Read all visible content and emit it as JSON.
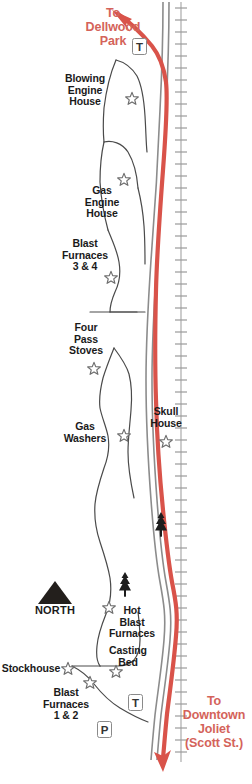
{
  "map": {
    "title": "Joliet Iron Works Historic Site Trail Map",
    "colors": {
      "route_red": "#d9534a",
      "road_gray": "#8c8c8c",
      "outline_gray": "#555555",
      "rail_gray": "#999999",
      "text_black": "#1a1a1a",
      "text_red": "#d4635a",
      "north_black": "#231f1c"
    },
    "direction_labels": [
      {
        "name": "to-dellwood-park",
        "text": "To\nDellwood\nPark",
        "x": 74,
        "y": 6,
        "width": 78
      },
      {
        "name": "to-downtown-joliet",
        "text": "To\nDowntown\nJoliet\n(Scott St.)",
        "x": 176,
        "y": 694,
        "width": 76
      }
    ],
    "site_labels": [
      {
        "name": "blowing-engine-house",
        "text": "Blowing\nEngine\nHouse",
        "x": 56,
        "y": 73,
        "width": 58
      },
      {
        "name": "gas-engine-house",
        "text": "Gas\nEngine\nHouse",
        "x": 79,
        "y": 185,
        "width": 46
      },
      {
        "name": "blast-furnaces-3-4",
        "text": "Blast\nFurnaces\n3 & 4",
        "x": 58,
        "y": 238,
        "width": 54
      },
      {
        "name": "four-pass-stoves",
        "text": "Four\nPass\nStoves",
        "x": 62,
        "y": 322,
        "width": 48
      },
      {
        "name": "gas-washers",
        "text": "Gas\nWashers",
        "x": 58,
        "y": 421,
        "width": 54
      },
      {
        "name": "skull-house",
        "text": "Skull\nHouse",
        "x": 146,
        "y": 406,
        "width": 40
      },
      {
        "name": "hot-blast-furnaces",
        "text": "Hot\nBlast\nFurnaces",
        "x": 105,
        "y": 605,
        "width": 54
      },
      {
        "name": "casting-bed",
        "text": "Casting\nBed",
        "x": 103,
        "y": 645,
        "width": 50
      },
      {
        "name": "stockhouse",
        "text": "Stockhouse",
        "x": 0,
        "y": 663,
        "width": 62
      },
      {
        "name": "blast-furnaces-1-2",
        "text": "Blast\nFurnaces\n1 & 2",
        "x": 38,
        "y": 687,
        "width": 56
      }
    ],
    "compass": {
      "name": "north-indicator",
      "label": "NORTH",
      "arrow_x": 38,
      "arrow_y": 581,
      "label_x": 28,
      "label_y": 605,
      "label_width": 54
    },
    "markers": [
      {
        "name": "trail-marker-north",
        "symbol": "T",
        "x": 132,
        "y": 38
      },
      {
        "name": "trail-marker-south",
        "symbol": "T",
        "x": 128,
        "y": 694
      },
      {
        "name": "parking-marker",
        "symbol": "P",
        "x": 97,
        "y": 721
      }
    ],
    "stars": [
      {
        "name": "star-blowing-engine-house",
        "x": 126,
        "y": 93
      },
      {
        "name": "star-gas-engine-house",
        "x": 118,
        "y": 174
      },
      {
        "name": "star-blast-furnaces-3-4",
        "x": 105,
        "y": 272
      },
      {
        "name": "star-four-pass-stoves",
        "x": 88,
        "y": 363
      },
      {
        "name": "star-gas-washers",
        "x": 118,
        "y": 430
      },
      {
        "name": "star-skull-house",
        "x": 160,
        "y": 436
      },
      {
        "name": "star-hot-blast-furnaces",
        "x": 103,
        "y": 602
      },
      {
        "name": "star-stockhouse",
        "x": 62,
        "y": 663
      },
      {
        "name": "star-blast-furnaces-1-2",
        "x": 84,
        "y": 677
      },
      {
        "name": "star-casting-bed",
        "x": 110,
        "y": 666
      }
    ],
    "trees": [
      {
        "name": "tree-upper",
        "x": 155,
        "y": 512
      },
      {
        "name": "tree-lower",
        "x": 119,
        "y": 572
      }
    ]
  }
}
